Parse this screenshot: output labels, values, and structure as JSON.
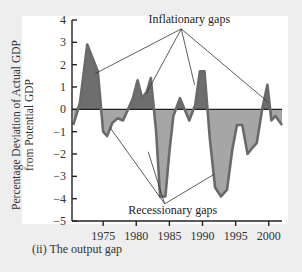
{
  "caption": "(ii) The output gap",
  "colors": {
    "background": "#eeeeee",
    "panel": "#ffffff",
    "inflationary_fill": "#6e6e6e",
    "recessionary_fill": "#a6a6a6",
    "line": "#6a6a6a",
    "axis": "#222222"
  },
  "chart_data": {
    "type": "area",
    "title": "",
    "xlabel": "",
    "ylabel": "Percentage Deviation of Actual GDP from Potential GDP",
    "ylabel_lines": [
      "Percentage Deviation of Actual GDP",
      "from Potential GDP"
    ],
    "ylim": [
      -5,
      4
    ],
    "xlim": [
      1970.3,
      2002
    ],
    "yticks": [
      4,
      3,
      2,
      1,
      0,
      -1,
      -2,
      -3,
      -4,
      -5
    ],
    "ytick_labels": [
      "4",
      "3",
      "2",
      "1",
      "0",
      "−1",
      "−2",
      "−3",
      "−4",
      "−5"
    ],
    "xticks": [
      1975,
      1980,
      1985,
      1990,
      1995,
      2000
    ],
    "xtick_labels": [
      "1975",
      "1980",
      "1985",
      "1990",
      "1995",
      "2000"
    ],
    "grid": false,
    "series": [
      {
        "name": "Output gap",
        "x": [
          1970.5,
          1971.5,
          1972.6,
          1973.4,
          1974.2,
          1975.0,
          1975.6,
          1976.4,
          1977.2,
          1978.0,
          1979.5,
          1980.2,
          1980.9,
          1981.6,
          1982.2,
          1983.0,
          1983.6,
          1984.4,
          1985.0,
          1985.6,
          1986.6,
          1988.0,
          1988.9,
          1989.6,
          1990.3,
          1991.1,
          1991.9,
          1992.8,
          1993.7,
          1994.5,
          1995.2,
          1996.0,
          1996.8,
          1997.6,
          1998.2,
          1999.0,
          1999.8,
          2000.4,
          2001.0,
          2002.0
        ],
        "values": [
          -0.7,
          0.3,
          2.9,
          2.3,
          1.7,
          -1.0,
          -1.2,
          -0.6,
          -0.4,
          -0.5,
          0.5,
          1.3,
          0.5,
          0.8,
          1.4,
          -1.0,
          -3.9,
          -3.9,
          -1.9,
          -0.3,
          0.5,
          -0.5,
          0.2,
          1.7,
          1.7,
          -1.3,
          -3.5,
          -3.9,
          -3.6,
          -1.8,
          -0.7,
          -0.7,
          -2.0,
          -1.7,
          -1.5,
          0.0,
          1.1,
          -0.5,
          -0.3,
          -0.7
        ]
      }
    ],
    "annotations": [
      {
        "text": "Inflationary gaps",
        "x": 1988.0,
        "y": 3.6,
        "arrows_to": [
          [
            1973.8,
            1.6
          ],
          [
            1981.5,
            0.7
          ],
          [
            1988.8,
            1.1
          ],
          [
            2000.0,
            0.3
          ]
        ]
      },
      {
        "text": "Recessionary gaps",
        "x": 1985.5,
        "y": -4.5,
        "arrows_to": [
          [
            1976.0,
            -0.8
          ],
          [
            1981.8,
            -1.9
          ],
          [
            1991.8,
            -2.9
          ]
        ]
      }
    ]
  }
}
